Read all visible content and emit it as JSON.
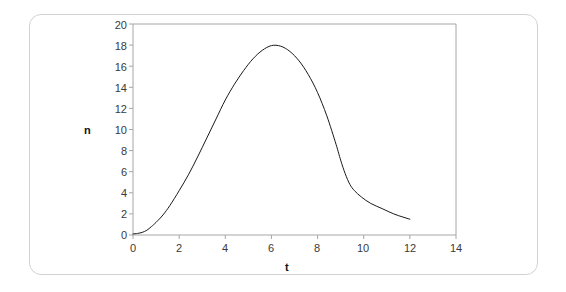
{
  "chart_data": {
    "type": "line",
    "title": "",
    "subtitle": "",
    "xlabel": "t",
    "ylabel": "n",
    "xlim": [
      0,
      14
    ],
    "ylim": [
      0,
      20
    ],
    "xticks": [
      0,
      2,
      4,
      6,
      8,
      10,
      12,
      14
    ],
    "yticks": [
      0,
      2,
      4,
      6,
      8,
      10,
      12,
      14,
      16,
      18,
      20
    ],
    "xtick_labels": [
      "0",
      "2",
      "4",
      "6",
      "8",
      "10",
      "12",
      "14"
    ],
    "ytick_labels": [
      "0",
      "2",
      "4",
      "6",
      "8",
      "10",
      "12",
      "14",
      "16",
      "18",
      "20"
    ],
    "grid": false,
    "legend": null,
    "legend_position": "none",
    "line_color": "#1a1a1a",
    "line_width": 1,
    "frame_color": "#a6a6a6",
    "series": [
      {
        "name": "n",
        "x": [
          0.0,
          0.2,
          0.4,
          0.6,
          0.8,
          1.0,
          1.3,
          1.6,
          2.0,
          2.4,
          2.8,
          3.2,
          3.6,
          4.0,
          4.4,
          4.8,
          5.2,
          5.6,
          6.0,
          6.4,
          6.8,
          7.2,
          7.6,
          8.0,
          8.4,
          8.8,
          9.0,
          9.2,
          9.4,
          9.6,
          9.9,
          10.3,
          10.8,
          11.3,
          11.7,
          12.0
        ],
        "y": [
          0.1,
          0.15,
          0.25,
          0.45,
          0.8,
          1.2,
          1.9,
          2.8,
          4.2,
          5.7,
          7.4,
          9.2,
          11.0,
          12.8,
          14.3,
          15.6,
          16.7,
          17.5,
          17.95,
          17.9,
          17.4,
          16.5,
          15.2,
          13.5,
          11.3,
          8.6,
          7.1,
          5.8,
          4.8,
          4.2,
          3.6,
          3.0,
          2.5,
          2.0,
          1.7,
          1.5
        ]
      }
    ]
  },
  "axes": {
    "x_axis_label": "t",
    "y_axis_label": "n"
  }
}
